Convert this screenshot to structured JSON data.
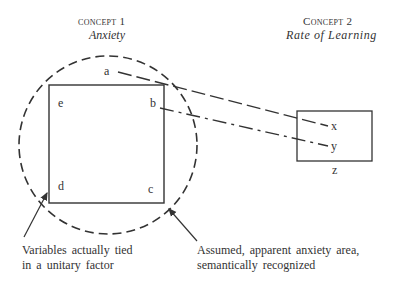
{
  "concept1": {
    "heading": "concept 1",
    "name": "Anxiety"
  },
  "concept2": {
    "heading": "Concept 2",
    "name": "Rate of Learning"
  },
  "square_labels": {
    "a": "a",
    "b": "b",
    "c": "c",
    "d": "d",
    "e": "e"
  },
  "box_labels": {
    "x": "x",
    "y": "y",
    "z": "z"
  },
  "annotations": {
    "left_line1": "Variables actually tied",
    "left_line2": "in a unitary factor",
    "right_line1": "Assumed, apparent anxiety area,",
    "right_line2": "semantically recognized"
  }
}
